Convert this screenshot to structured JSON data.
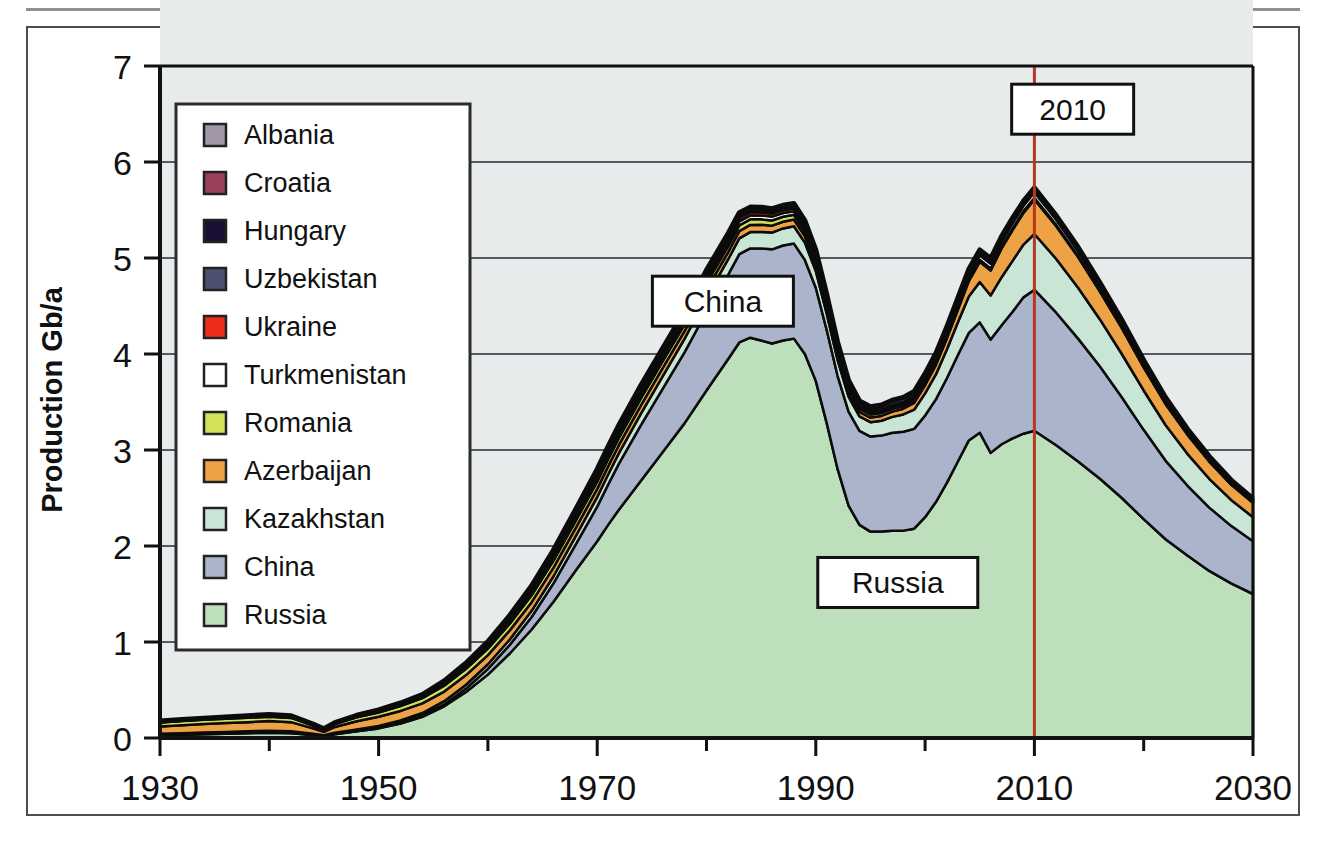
{
  "figure": {
    "frame_color": "#4a4f54",
    "background": "#ffffff",
    "plot_background": "#e8ebec",
    "gridline_color": "#555a5f",
    "axis_color": "#111111",
    "series_outline": "#0b0b0b"
  },
  "chart_data": {
    "type": "area",
    "stacked": true,
    "title": "",
    "subtitle": "",
    "xlabel": "",
    "ylabel": "Production Gb/a",
    "xlim": [
      1930,
      2030
    ],
    "ylim": [
      0,
      7
    ],
    "yticks": [
      0,
      1,
      2,
      3,
      4,
      5,
      6,
      7
    ],
    "ytick_labels": [
      "0",
      "1",
      "2",
      "3",
      "4",
      "5",
      "6",
      "7"
    ],
    "xticks": [
      1930,
      1950,
      1970,
      1990,
      2010,
      2030
    ],
    "xtick_labels": [
      "1930",
      "1950",
      "1970",
      "1990",
      "2010",
      "2030"
    ],
    "x_minor_tick_step": 10,
    "grid": "horizontal",
    "legend_position": "upper-left-inside",
    "x": [
      1930,
      1932,
      1934,
      1936,
      1938,
      1940,
      1942,
      1944,
      1945,
      1946,
      1948,
      1950,
      1952,
      1954,
      1956,
      1958,
      1960,
      1962,
      1964,
      1966,
      1968,
      1970,
      1971,
      1972,
      1974,
      1976,
      1978,
      1980,
      1982,
      1983,
      1984,
      1985,
      1986,
      1987,
      1988,
      1989,
      1990,
      1991,
      1992,
      1993,
      1994,
      1995,
      1996,
      1997,
      1998,
      1999,
      2000,
      2001,
      2002,
      2003,
      2004,
      2005,
      2006,
      2007,
      2008,
      2009,
      2010,
      2012,
      2014,
      2016,
      2018,
      2020,
      2022,
      2024,
      2026,
      2028,
      2030
    ],
    "series": [
      {
        "name": "Russia",
        "color": "#bddfbb",
        "values": [
          0.03,
          0.035,
          0.04,
          0.045,
          0.05,
          0.055,
          0.05,
          0.03,
          0.02,
          0.04,
          0.07,
          0.1,
          0.15,
          0.22,
          0.33,
          0.48,
          0.66,
          0.88,
          1.13,
          1.42,
          1.74,
          2.05,
          2.22,
          2.38,
          2.68,
          2.98,
          3.28,
          3.62,
          3.95,
          4.12,
          4.17,
          4.14,
          4.11,
          4.14,
          4.16,
          4.0,
          3.72,
          3.28,
          2.8,
          2.42,
          2.22,
          2.15,
          2.15,
          2.16,
          2.16,
          2.18,
          2.3,
          2.46,
          2.66,
          2.88,
          3.1,
          3.18,
          2.97,
          3.06,
          3.12,
          3.17,
          3.2,
          3.05,
          2.88,
          2.7,
          2.5,
          2.28,
          2.07,
          1.9,
          1.74,
          1.61,
          1.5
        ]
      },
      {
        "name": "China",
        "color": "#aab4cb",
        "values": [
          0.002,
          0.002,
          0.003,
          0.003,
          0.004,
          0.004,
          0.004,
          0.003,
          0.002,
          0.003,
          0.004,
          0.006,
          0.008,
          0.012,
          0.02,
          0.035,
          0.06,
          0.09,
          0.13,
          0.19,
          0.27,
          0.36,
          0.42,
          0.48,
          0.58,
          0.66,
          0.74,
          0.82,
          0.88,
          0.92,
          0.93,
          0.96,
          0.98,
          0.99,
          0.99,
          0.98,
          0.97,
          0.97,
          0.97,
          0.98,
          0.98,
          0.99,
          1.0,
          1.02,
          1.03,
          1.04,
          1.06,
          1.07,
          1.09,
          1.11,
          1.12,
          1.15,
          1.18,
          1.24,
          1.32,
          1.42,
          1.47,
          1.38,
          1.28,
          1.17,
          1.05,
          0.93,
          0.82,
          0.73,
          0.66,
          0.6,
          0.55
        ]
      },
      {
        "name": "Kazakhstan",
        "color": "#c9e5d6",
        "values": [
          0.012,
          0.013,
          0.014,
          0.015,
          0.016,
          0.017,
          0.016,
          0.012,
          0.008,
          0.012,
          0.016,
          0.02,
          0.024,
          0.028,
          0.034,
          0.04,
          0.048,
          0.056,
          0.065,
          0.075,
          0.086,
          0.1,
          0.105,
          0.11,
          0.12,
          0.13,
          0.14,
          0.15,
          0.16,
          0.165,
          0.17,
          0.172,
          0.175,
          0.178,
          0.18,
          0.18,
          0.175,
          0.17,
          0.165,
          0.155,
          0.15,
          0.15,
          0.155,
          0.165,
          0.18,
          0.2,
          0.23,
          0.26,
          0.3,
          0.34,
          0.38,
          0.42,
          0.46,
          0.5,
          0.53,
          0.55,
          0.58,
          0.56,
          0.53,
          0.49,
          0.45,
          0.41,
          0.37,
          0.33,
          0.3,
          0.27,
          0.25
        ]
      },
      {
        "name": "Azerbaijan",
        "color": "#eda246",
        "values": [
          0.075,
          0.082,
          0.088,
          0.092,
          0.095,
          0.1,
          0.095,
          0.055,
          0.035,
          0.06,
          0.085,
          0.095,
          0.1,
          0.1,
          0.1,
          0.1,
          0.095,
          0.095,
          0.09,
          0.09,
          0.085,
          0.085,
          0.085,
          0.085,
          0.085,
          0.085,
          0.08,
          0.08,
          0.075,
          0.075,
          0.075,
          0.075,
          0.072,
          0.07,
          0.07,
          0.068,
          0.065,
          0.06,
          0.055,
          0.05,
          0.048,
          0.048,
          0.05,
          0.055,
          0.06,
          0.07,
          0.085,
          0.1,
          0.115,
          0.13,
          0.16,
          0.21,
          0.26,
          0.3,
          0.32,
          0.33,
          0.36,
          0.34,
          0.32,
          0.29,
          0.27,
          0.24,
          0.22,
          0.2,
          0.18,
          0.16,
          0.15
        ]
      },
      {
        "name": "Romania",
        "color": "#d2e05a",
        "values": [
          0.042,
          0.044,
          0.045,
          0.046,
          0.046,
          0.046,
          0.044,
          0.03,
          0.02,
          0.03,
          0.04,
          0.045,
          0.05,
          0.055,
          0.06,
          0.065,
          0.068,
          0.07,
          0.072,
          0.073,
          0.074,
          0.075,
          0.074,
          0.073,
          0.072,
          0.07,
          0.068,
          0.066,
          0.062,
          0.06,
          0.058,
          0.056,
          0.054,
          0.052,
          0.05,
          0.048,
          0.045,
          0.042,
          0.038,
          0.035,
          0.033,
          0.032,
          0.031,
          0.03,
          0.029,
          0.028,
          0.027,
          0.026,
          0.025,
          0.024,
          0.023,
          0.022,
          0.021,
          0.02,
          0.019,
          0.018,
          0.017,
          0.015,
          0.013,
          0.011,
          0.01,
          0.008,
          0.007,
          0.006,
          0.005,
          0.004,
          0.004
        ]
      },
      {
        "name": "Turkmenistan",
        "color": "#ffffff",
        "values": [
          0.004,
          0.004,
          0.005,
          0.005,
          0.005,
          0.006,
          0.006,
          0.004,
          0.003,
          0.004,
          0.006,
          0.007,
          0.008,
          0.009,
          0.012,
          0.014,
          0.016,
          0.018,
          0.02,
          0.022,
          0.025,
          0.028,
          0.03,
          0.032,
          0.035,
          0.038,
          0.04,
          0.042,
          0.042,
          0.042,
          0.04,
          0.04,
          0.04,
          0.038,
          0.038,
          0.036,
          0.034,
          0.03,
          0.026,
          0.022,
          0.02,
          0.02,
          0.02,
          0.022,
          0.024,
          0.026,
          0.03,
          0.033,
          0.036,
          0.04,
          0.043,
          0.046,
          0.05,
          0.053,
          0.055,
          0.056,
          0.058,
          0.054,
          0.05,
          0.046,
          0.042,
          0.038,
          0.034,
          0.03,
          0.027,
          0.024,
          0.022
        ]
      },
      {
        "name": "Ukraine",
        "color": "#ec2d19",
        "values": [
          0.005,
          0.005,
          0.005,
          0.005,
          0.006,
          0.006,
          0.005,
          0.003,
          0.002,
          0.003,
          0.005,
          0.006,
          0.008,
          0.01,
          0.015,
          0.02,
          0.027,
          0.033,
          0.04,
          0.045,
          0.05,
          0.052,
          0.052,
          0.05,
          0.048,
          0.045,
          0.042,
          0.04,
          0.037,
          0.035,
          0.034,
          0.033,
          0.032,
          0.031,
          0.03,
          0.029,
          0.028,
          0.026,
          0.024,
          0.022,
          0.02,
          0.019,
          0.018,
          0.018,
          0.017,
          0.017,
          0.017,
          0.017,
          0.017,
          0.017,
          0.017,
          0.017,
          0.016,
          0.016,
          0.016,
          0.015,
          0.015,
          0.014,
          0.013,
          0.012,
          0.011,
          0.01,
          0.009,
          0.008,
          0.007,
          0.006,
          0.006
        ]
      },
      {
        "name": "Uzbekistan",
        "color": "#4b5073",
        "values": [
          0.003,
          0.003,
          0.003,
          0.004,
          0.004,
          0.004,
          0.004,
          0.003,
          0.002,
          0.003,
          0.004,
          0.005,
          0.006,
          0.007,
          0.009,
          0.011,
          0.013,
          0.015,
          0.017,
          0.019,
          0.021,
          0.023,
          0.024,
          0.025,
          0.026,
          0.027,
          0.028,
          0.028,
          0.028,
          0.028,
          0.028,
          0.028,
          0.027,
          0.027,
          0.027,
          0.026,
          0.026,
          0.025,
          0.024,
          0.024,
          0.025,
          0.027,
          0.03,
          0.033,
          0.035,
          0.035,
          0.034,
          0.033,
          0.032,
          0.031,
          0.03,
          0.029,
          0.028,
          0.027,
          0.026,
          0.025,
          0.024,
          0.022,
          0.02,
          0.018,
          0.016,
          0.014,
          0.013,
          0.011,
          0.01,
          0.009,
          0.008
        ]
      },
      {
        "name": "Hungary",
        "color": "#1b1033",
        "values": [
          0.002,
          0.002,
          0.002,
          0.003,
          0.003,
          0.004,
          0.004,
          0.003,
          0.002,
          0.003,
          0.004,
          0.005,
          0.006,
          0.007,
          0.008,
          0.009,
          0.01,
          0.011,
          0.012,
          0.013,
          0.014,
          0.015,
          0.015,
          0.015,
          0.015,
          0.015,
          0.015,
          0.015,
          0.014,
          0.014,
          0.014,
          0.014,
          0.013,
          0.013,
          0.013,
          0.012,
          0.012,
          0.011,
          0.011,
          0.01,
          0.01,
          0.009,
          0.009,
          0.009,
          0.008,
          0.008,
          0.008,
          0.007,
          0.007,
          0.007,
          0.006,
          0.006,
          0.006,
          0.005,
          0.005,
          0.005,
          0.005,
          0.004,
          0.004,
          0.003,
          0.003,
          0.003,
          0.002,
          0.002,
          0.002,
          0.002,
          0.001
        ]
      },
      {
        "name": "Croatia",
        "color": "#9b4159",
        "values": [
          0.001,
          0.001,
          0.001,
          0.001,
          0.002,
          0.002,
          0.002,
          0.001,
          0.001,
          0.001,
          0.002,
          0.002,
          0.003,
          0.003,
          0.004,
          0.005,
          0.005,
          0.006,
          0.006,
          0.007,
          0.007,
          0.008,
          0.008,
          0.008,
          0.008,
          0.008,
          0.008,
          0.008,
          0.007,
          0.007,
          0.007,
          0.007,
          0.007,
          0.006,
          0.006,
          0.006,
          0.006,
          0.005,
          0.005,
          0.004,
          0.004,
          0.004,
          0.004,
          0.004,
          0.003,
          0.003,
          0.003,
          0.003,
          0.003,
          0.003,
          0.002,
          0.002,
          0.002,
          0.002,
          0.002,
          0.002,
          0.002,
          0.002,
          0.001,
          0.001,
          0.001,
          0.001,
          0.001,
          0.001,
          0.001,
          0.001,
          0.001
        ]
      },
      {
        "name": "Albania",
        "color": "#a297a8",
        "values": [
          0.001,
          0.001,
          0.001,
          0.001,
          0.001,
          0.001,
          0.001,
          0.001,
          0.001,
          0.001,
          0.001,
          0.001,
          0.002,
          0.002,
          0.002,
          0.003,
          0.003,
          0.003,
          0.004,
          0.004,
          0.004,
          0.005,
          0.005,
          0.005,
          0.005,
          0.005,
          0.005,
          0.005,
          0.005,
          0.005,
          0.004,
          0.004,
          0.004,
          0.004,
          0.004,
          0.004,
          0.003,
          0.003,
          0.003,
          0.003,
          0.002,
          0.002,
          0.002,
          0.002,
          0.002,
          0.002,
          0.002,
          0.002,
          0.002,
          0.002,
          0.002,
          0.002,
          0.002,
          0.002,
          0.002,
          0.001,
          0.001,
          0.001,
          0.001,
          0.001,
          0.001,
          0.001,
          0.001,
          0.001,
          0.001,
          0.001,
          0.001
        ]
      }
    ],
    "annotations": [
      {
        "id": "china-callout",
        "text": "China",
        "x": 1981.5,
        "y": 4.55,
        "type": "boxed-label"
      },
      {
        "id": "russia-callout",
        "text": "Russia",
        "x": 1997.5,
        "y": 1.62,
        "type": "boxed-label"
      },
      {
        "id": "year-callout",
        "text": "2010",
        "x": 2013.5,
        "y": 6.55,
        "type": "boxed-label"
      }
    ],
    "marker_lines": [
      {
        "id": "year-2010-line",
        "x": 2010,
        "color": "#b5381f",
        "label": "2010"
      }
    ]
  },
  "legend": {
    "border_color": "#2b2b2b",
    "background": "#ffffff",
    "items": [
      {
        "label": "Albania",
        "color": "#a297a8"
      },
      {
        "label": "Croatia",
        "color": "#9b4159"
      },
      {
        "label": "Hungary",
        "color": "#1b1033"
      },
      {
        "label": "Uzbekistan",
        "color": "#4b5073"
      },
      {
        "label": "Ukraine",
        "color": "#ec2d19"
      },
      {
        "label": "Turkmenistan",
        "color": "#ffffff"
      },
      {
        "label": "Romania",
        "color": "#d2e05a"
      },
      {
        "label": "Azerbaijan",
        "color": "#eda246"
      },
      {
        "label": "Kazakhstan",
        "color": "#c9e5d6"
      },
      {
        "label": "China",
        "color": "#aab4cb"
      },
      {
        "label": "Russia",
        "color": "#bddfbb"
      }
    ]
  }
}
